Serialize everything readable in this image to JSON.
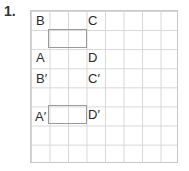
{
  "question": {
    "number": "1."
  },
  "grid": {
    "columns": 8,
    "rows": 8
  },
  "shape_original": {
    "labels": {
      "B": "B",
      "C": "C",
      "A": "A",
      "D": "D"
    }
  },
  "shape_image": {
    "labels": {
      "B": "B′",
      "C": "C′",
      "A": "A′",
      "D": "D′"
    }
  },
  "colors": {
    "grid_line": "#d6d6d6",
    "rectangle": "#9a9a9a"
  }
}
